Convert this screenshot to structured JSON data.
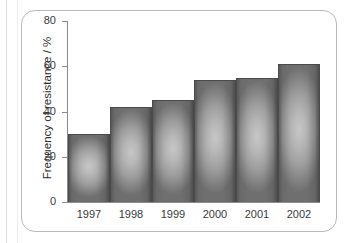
{
  "chart_data": {
    "type": "bar",
    "title": "",
    "subtitle": "",
    "xlabel": "",
    "ylabel": "Frequency of resistance / %",
    "categories": [
      "1997",
      "1998",
      "1999",
      "2000",
      "2001",
      "2002"
    ],
    "values": [
      30,
      42,
      45,
      54,
      55,
      61
    ],
    "series": [
      {
        "name": "Frequency of resistance",
        "values": [
          30,
          42,
          45,
          54,
          55,
          61
        ]
      }
    ],
    "ylim": [
      0,
      80
    ],
    "yticks": [
      0,
      20,
      40,
      60,
      80
    ],
    "ytick_labels": [
      "0",
      "20",
      "40",
      "60",
      "80"
    ],
    "grid": false,
    "legend": false,
    "legend_position": "none",
    "bar_color": "#9d9d9d",
    "bar_edge_color": "#4a4a4a",
    "axis_color": "#8b8b8b",
    "text_color": "#3a3a3a",
    "frame_color": "#b9b9b9",
    "background_color": "#ffffff"
  },
  "axis": {
    "y_title": "Frequency of resistance / %",
    "y_ticks": [
      {
        "label": "80",
        "value": 80
      },
      {
        "label": "60",
        "value": 60
      },
      {
        "label": "40",
        "value": 40
      },
      {
        "label": "20",
        "value": 20
      },
      {
        "label": "0",
        "value": 0
      }
    ],
    "x_ticks": [
      {
        "label": "1997"
      },
      {
        "label": "1998"
      },
      {
        "label": "1999"
      },
      {
        "label": "2000"
      },
      {
        "label": "2001"
      },
      {
        "label": "2002"
      }
    ]
  }
}
